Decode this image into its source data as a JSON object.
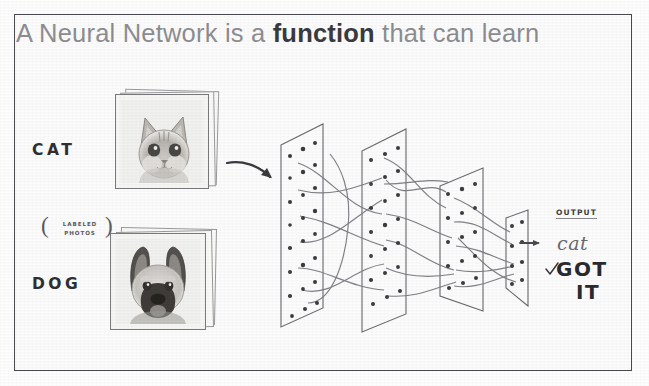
{
  "slide": {
    "title_plain_before": "A Neural Network is a ",
    "title_bold": "function",
    "title_plain_after": " that can learn",
    "title_color": "#8e8e92",
    "title_bold_color": "#3b3b3f",
    "frame_color": "#4b4b4f",
    "background": "#fdfdfd"
  },
  "inputs": {
    "label_cat": "CAT",
    "label_dog": "DOG",
    "annotation_line1": "LABELED",
    "annotation_line2": "PHOTOS",
    "paren_left": "(",
    "paren_right": ")",
    "photo_cat_alt": "photo of a cat",
    "photo_dog_alt": "photo of a dog"
  },
  "arrows": {
    "input_arrow": "curved-arrow-right",
    "output_arrow": "small-arrow-right"
  },
  "network": {
    "layer_count": 4,
    "layers": [
      {
        "name": "input-layer",
        "nodes": 20
      },
      {
        "name": "hidden-layer-1",
        "nodes": 18
      },
      {
        "name": "hidden-layer-2",
        "nodes": 14
      },
      {
        "name": "output-layer",
        "nodes": 8
      }
    ],
    "ink_color": "#55555a"
  },
  "output": {
    "heading": "OUTPUT",
    "prediction": "cat",
    "verdict_line1": "GOT",
    "verdict_line2": "IT",
    "check_glyph": "check-mark"
  }
}
